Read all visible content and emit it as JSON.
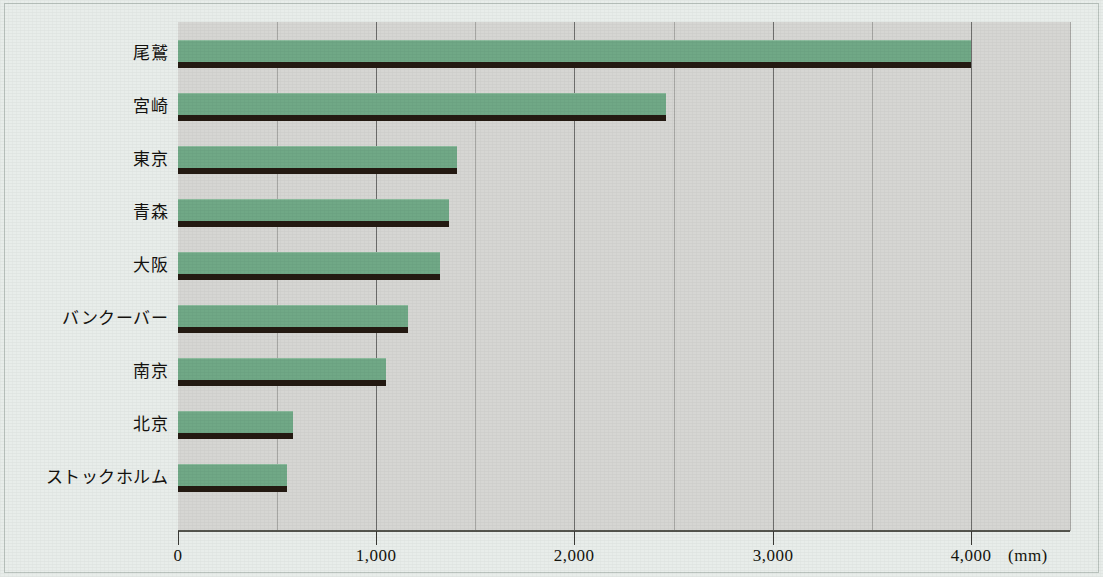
{
  "chart_data": {
    "type": "bar",
    "orientation": "horizontal",
    "title": "",
    "xlabel": "(mm)",
    "ylabel": "",
    "unit": "(mm)",
    "xlim": [
      0,
      4500
    ],
    "grid": true,
    "grid_major_step": 1000,
    "grid_minor_step": 500,
    "legend": "none",
    "xticks": [
      0,
      1000,
      2000,
      3000,
      4000
    ],
    "xtick_labels": [
      "0",
      "1,000",
      "2,000",
      "3,000",
      "4,000"
    ],
    "categories": [
      "尾鷲",
      "宮崎",
      "東京",
      "青森",
      "大阪",
      "バンクーバー",
      "南京",
      "北京",
      "ストックホルム"
    ],
    "values": [
      4000,
      2460,
      1405,
      1365,
      1320,
      1160,
      1050,
      580,
      550
    ],
    "bar_color": "#70a886",
    "bar_shadow_color": "#241a12",
    "plot_background": "#d6d6d3",
    "page_background": "#e8edea",
    "axis_color": "#55564f"
  },
  "figure": {
    "unit_label": "(mm)"
  }
}
